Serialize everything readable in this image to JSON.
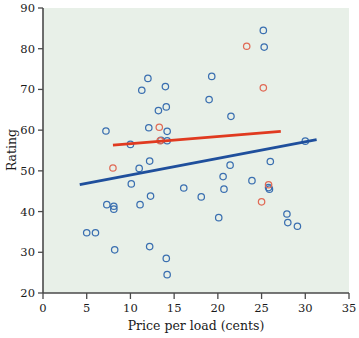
{
  "chart_data": {
    "type": "scatter",
    "title": "",
    "xlabel": "Price per load (cents)",
    "ylabel": "Rating",
    "xlim": [
      0,
      35
    ],
    "ylim": [
      20,
      90
    ],
    "xticks": [
      0,
      5,
      10,
      15,
      20,
      25,
      30,
      35
    ],
    "yticks": [
      20,
      30,
      40,
      50,
      60,
      70,
      80,
      90
    ],
    "grid": false,
    "legend": "none",
    "plot_background": "#e8f0e8",
    "series": [
      {
        "name": "blue-points",
        "marker": "open-circle",
        "color": "#3a6fb0",
        "points": [
          [
            5.0,
            34.8
          ],
          [
            6.0,
            34.8
          ],
          [
            7.2,
            59.8
          ],
          [
            7.3,
            41.7
          ],
          [
            8.1,
            41.3
          ],
          [
            8.1,
            40.6
          ],
          [
            8.2,
            30.6
          ],
          [
            10.0,
            56.5
          ],
          [
            10.1,
            46.8
          ],
          [
            11.0,
            50.6
          ],
          [
            11.1,
            41.7
          ],
          [
            11.3,
            69.8
          ],
          [
            12.0,
            72.7
          ],
          [
            12.1,
            60.6
          ],
          [
            12.2,
            52.4
          ],
          [
            12.3,
            43.8
          ],
          [
            12.2,
            31.4
          ],
          [
            13.2,
            64.8
          ],
          [
            13.5,
            57.5
          ],
          [
            14.0,
            70.7
          ],
          [
            14.1,
            65.7
          ],
          [
            14.2,
            59.7
          ],
          [
            14.2,
            57.4
          ],
          [
            14.1,
            28.5
          ],
          [
            14.2,
            24.5
          ],
          [
            16.1,
            45.8
          ],
          [
            18.1,
            43.6
          ],
          [
            19.3,
            73.2
          ],
          [
            19.0,
            67.5
          ],
          [
            20.1,
            38.5
          ],
          [
            20.6,
            48.6
          ],
          [
            20.7,
            45.5
          ],
          [
            21.5,
            63.4
          ],
          [
            21.4,
            51.4
          ],
          [
            23.9,
            47.6
          ],
          [
            25.2,
            84.5
          ],
          [
            25.3,
            80.4
          ],
          [
            25.8,
            45.9
          ],
          [
            25.9,
            45.5
          ],
          [
            26.0,
            52.3
          ],
          [
            27.9,
            39.4
          ],
          [
            28.0,
            37.3
          ],
          [
            29.1,
            36.4
          ],
          [
            30.0,
            57.3
          ]
        ]
      },
      {
        "name": "red-points",
        "marker": "open-circle",
        "color": "#e06a55",
        "points": [
          [
            8.0,
            50.7
          ],
          [
            13.3,
            60.7
          ],
          [
            13.4,
            57.4
          ],
          [
            23.3,
            80.6
          ],
          [
            25.2,
            70.4
          ],
          [
            25.8,
            46.6
          ],
          [
            25.0,
            42.4
          ]
        ]
      }
    ],
    "trend_lines": [
      {
        "name": "red-trend-line",
        "color": "#e03a20",
        "x0": 8.0,
        "y0": 56.3,
        "x1": 27.2,
        "y1": 59.7
      },
      {
        "name": "blue-trend-line",
        "color": "#1f4f9c",
        "x0": 4.2,
        "y0": 46.6,
        "x1": 31.3,
        "y1": 57.7
      }
    ]
  },
  "axes": {
    "y_title": "Rating",
    "x_title": "Price per load (cents)"
  }
}
